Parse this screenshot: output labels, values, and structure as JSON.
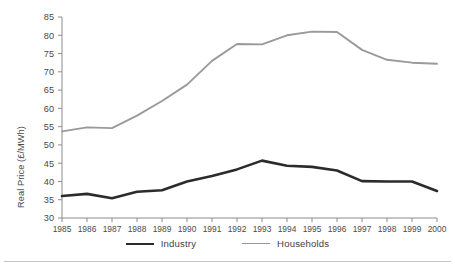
{
  "chart_data": {
    "type": "line",
    "title": "",
    "xlabel": "",
    "ylabel": "Real Price (£/MWh)",
    "x": [
      1985,
      1986,
      1987,
      1988,
      1989,
      1990,
      1991,
      1992,
      1993,
      1994,
      1995,
      1996,
      1997,
      1998,
      1999,
      2000
    ],
    "xtick_labels": [
      "1985",
      "1986",
      "1987",
      "1988",
      "1989",
      "1990",
      "1991",
      "1992",
      "1993",
      "1994",
      "1995",
      "1996",
      "1997",
      "1998",
      "1999",
      "2000"
    ],
    "ytick_labels": [
      "30",
      "35",
      "40",
      "45",
      "50",
      "55",
      "60",
      "65",
      "70",
      "75",
      "80",
      "85"
    ],
    "yticks": [
      30,
      35,
      40,
      45,
      50,
      55,
      60,
      65,
      70,
      75,
      80,
      85
    ],
    "ylim": [
      30,
      85
    ],
    "xlim": [
      1985,
      2000
    ],
    "grid": false,
    "legend_position": "bottom",
    "series": [
      {
        "name": "Industry",
        "color": "#2b2b2b",
        "line_width": 2.6,
        "values": [
          36.0,
          36.6,
          35.4,
          37.2,
          37.6,
          40.0,
          41.5,
          43.3,
          45.7,
          44.3,
          44.0,
          43.0,
          40.1,
          40.0,
          40.0,
          37.4
        ]
      },
      {
        "name": "Households",
        "color": "#9a9a9a",
        "line_width": 1.9,
        "values": [
          53.7,
          54.8,
          54.6,
          58.0,
          62.0,
          66.5,
          73.0,
          77.6,
          77.5,
          80.0,
          81.0,
          80.9,
          76.0,
          73.3,
          72.5,
          72.2
        ]
      }
    ]
  },
  "legend": {
    "items": [
      {
        "label": "Industry"
      },
      {
        "label": "Households"
      }
    ]
  },
  "axis": {
    "y_title": "Real Price (£/MWh)"
  },
  "colors": {
    "industry": "#2b2b2b",
    "households": "#9a9a9a",
    "axis": "#8c8c8c",
    "text": "#4a4a4a",
    "rule": "#c6c6c6",
    "background": "#ffffff"
  }
}
